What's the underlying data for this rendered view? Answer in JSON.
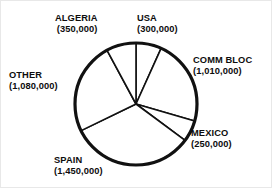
{
  "chart_data": {
    "type": "pie",
    "title": "",
    "subtitle": "",
    "xlabel": "",
    "ylabel": "",
    "legend_position": "none",
    "grid": false,
    "total": 4440000,
    "units": "barrels per day",
    "categories": [
      "USA",
      "COMM BLOC",
      "MEXICO",
      "SPAIN",
      "OTHER",
      "ALGERIA"
    ],
    "values": [
      300000,
      1010000,
      250000,
      1450000,
      1080000,
      350000
    ],
    "value_labels": [
      "(300,000)",
      "(1,010,000)",
      "(250,000)",
      "(1,450,000)",
      "(1,080,000)",
      "(350,000)"
    ],
    "slices": [
      {
        "name": "USA",
        "value": 300000,
        "label": "USA",
        "value_label": "(300,000)",
        "start_angle": 0,
        "end_angle": 24.3,
        "color": "#ffffff"
      },
      {
        "name": "COMM BLOC",
        "value": 1010000,
        "label": "COMM BLOC",
        "value_label": "(1,010,000)",
        "start_angle": 24.3,
        "end_angle": 106.2,
        "color": "#ffffff"
      },
      {
        "name": "MEXICO",
        "value": 250000,
        "label": "MEXICO",
        "value_label": "(250,000)",
        "start_angle": 106.2,
        "end_angle": 126.5,
        "color": "#ffffff"
      },
      {
        "name": "SPAIN",
        "value": 1450000,
        "label": "SPAIN",
        "value_label": "(1,450,000)",
        "start_angle": 126.5,
        "end_angle": 244.1,
        "color": "#ffffff"
      },
      {
        "name": "OTHER",
        "value": 1080000,
        "label": "OTHER",
        "value_label": "(1,080,000)",
        "start_angle": 244.1,
        "end_angle": 331.7,
        "color": "#ffffff"
      },
      {
        "name": "ALGERIA",
        "value": 350000,
        "label": "ALGERIA",
        "value_label": "(350,000)",
        "start_angle": 331.7,
        "end_angle": 360,
        "color": "#ffffff"
      }
    ],
    "geometry": {
      "center_x": 135,
      "center_y": 103,
      "radius": 61
    },
    "style": {
      "fill": "#ffffff",
      "stroke": "#111111",
      "background": "#ffffff"
    }
  },
  "labels": {
    "algeria": {
      "name": "ALGERIA",
      "value": "(350,000)"
    },
    "usa": {
      "name": "USA",
      "value": "(300,000)"
    },
    "comm": {
      "name": "COMM BLOC",
      "value": "(1,010,000)"
    },
    "mexico": {
      "name": "MEXICO",
      "value": "(250,000)"
    },
    "spain": {
      "name": "SPAIN",
      "value": "(1,450,000)"
    },
    "other": {
      "name": "OTHER",
      "value": "(1,080,000)"
    }
  }
}
